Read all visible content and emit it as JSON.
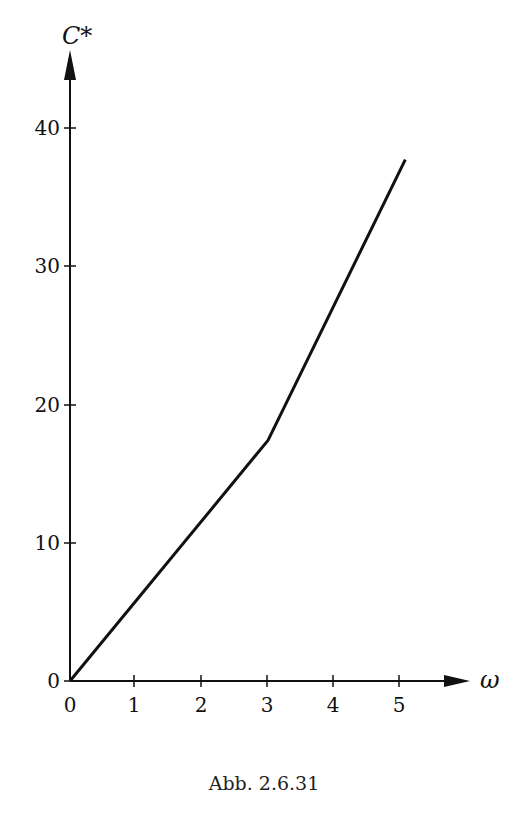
{
  "chart_data": {
    "type": "line",
    "title": "",
    "xlabel": "ω",
    "ylabel": "C*",
    "xlim": [
      0,
      5.8
    ],
    "ylim": [
      0,
      44
    ],
    "grid": false,
    "legend": null,
    "x_ticks": [
      0,
      1,
      2,
      3,
      4,
      5
    ],
    "y_ticks": [
      0,
      10,
      20,
      30,
      40
    ],
    "series": [
      {
        "name": "C*(ω)",
        "x": [
          0,
          3,
          5.08
        ],
        "y": [
          0,
          17.4,
          37.7
        ]
      }
    ]
  },
  "caption": "Abb. 2.6.31",
  "labels": {
    "x_axis": "ω",
    "y_axis": "C*",
    "x_ticks": [
      "0",
      "1",
      "2",
      "3",
      "4",
      "5"
    ],
    "y_ticks": [
      "0",
      "10",
      "20",
      "30",
      "40"
    ]
  }
}
